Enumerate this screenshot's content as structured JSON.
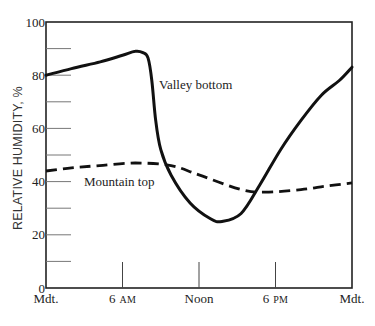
{
  "chart_data": {
    "type": "line",
    "title": "",
    "xlabel": "",
    "ylabel": "RELATIVE HUMIDITY, %",
    "ylim": [
      0,
      100
    ],
    "xlim_hours": [
      0,
      24
    ],
    "y_ticks": [
      0,
      20,
      40,
      60,
      80,
      100
    ],
    "y_minor_ticks": [
      10,
      20,
      30,
      40,
      50,
      60,
      70,
      80,
      90
    ],
    "x_ticks": [
      {
        "hour": 0,
        "label": "Mdt.",
        "suffix": ""
      },
      {
        "hour": 6,
        "label": "6",
        "suffix": "AM"
      },
      {
        "hour": 12,
        "label": "Noon",
        "suffix": ""
      },
      {
        "hour": 18,
        "label": "6",
        "suffix": "PM"
      },
      {
        "hour": 24,
        "label": "Mdt.",
        "suffix": ""
      }
    ],
    "grid": false,
    "legend": "inline labels",
    "series": [
      {
        "name": "Valley bottom",
        "style": "solid",
        "x": [
          0,
          2,
          4.25,
          6,
          7,
          7.6,
          8.0,
          8.3,
          8.6,
          9.0,
          9.8,
          11.3,
          12.9,
          13.8,
          15.3,
          16.8,
          18.4,
          20.0,
          21.6,
          23.0,
          24
        ],
        "values": [
          80,
          82.5,
          85,
          87.5,
          89,
          88.5,
          86.5,
          78,
          63,
          52,
          42.5,
          32,
          26,
          25,
          28,
          39,
          52,
          63,
          72.5,
          78,
          83
        ]
      },
      {
        "name": "Mountain top",
        "style": "dashed",
        "x": [
          0,
          2,
          4.2,
          7,
          9.8,
          12,
          15.3,
          17.2,
          20,
          22,
          24
        ],
        "values": [
          44,
          45.2,
          46,
          47,
          46,
          42.5,
          37,
          36,
          37,
          38.3,
          39.5
        ]
      }
    ],
    "annotations": [
      {
        "text": "Valley bottom",
        "hour": 8.9,
        "value": 76
      },
      {
        "text": "Mountain top",
        "hour": 3.0,
        "value": 39.5
      }
    ]
  },
  "labels": {
    "y_axis_title": "RELATIVE HUMIDITY, %",
    "valley": "Valley bottom",
    "mountain": "Mountain top"
  }
}
